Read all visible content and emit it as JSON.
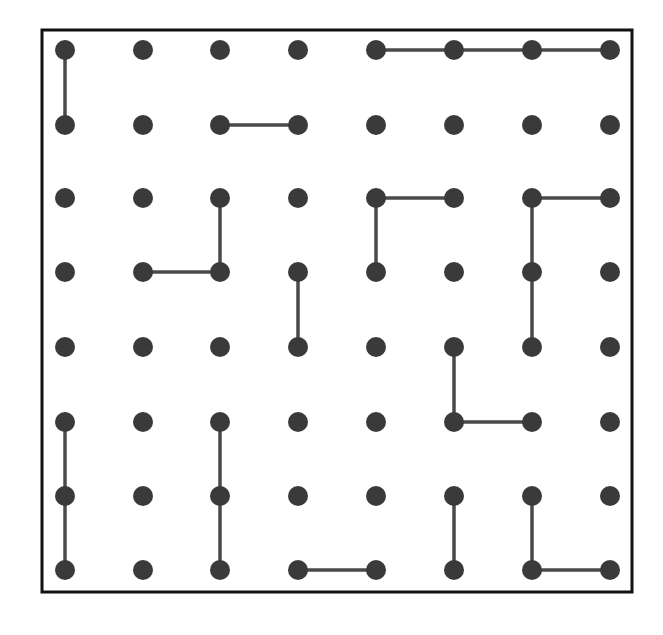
{
  "puzzle": {
    "type": "dot-grid",
    "columns": 8,
    "rows": 8,
    "colors": {
      "dot": "#3a3a3a",
      "line": "#4a4a4a",
      "border": "#111111",
      "background": "#ffffff"
    },
    "x_positions": [
      65,
      143,
      220,
      298,
      376,
      454,
      532,
      610
    ],
    "y_positions": [
      50,
      125,
      198,
      272,
      347,
      422,
      496,
      570
    ],
    "segments": [
      [
        [
          0,
          0
        ],
        [
          0,
          1
        ]
      ],
      [
        [
          4,
          0
        ],
        [
          5,
          0
        ]
      ],
      [
        [
          5,
          0
        ],
        [
          6,
          0
        ]
      ],
      [
        [
          6,
          0
        ],
        [
          7,
          0
        ]
      ],
      [
        [
          2,
          1
        ],
        [
          3,
          1
        ]
      ],
      [
        [
          4,
          2
        ],
        [
          5,
          2
        ]
      ],
      [
        [
          4,
          2
        ],
        [
          4,
          3
        ]
      ],
      [
        [
          6,
          2
        ],
        [
          7,
          2
        ]
      ],
      [
        [
          6,
          2
        ],
        [
          6,
          3
        ]
      ],
      [
        [
          6,
          3
        ],
        [
          6,
          4
        ]
      ],
      [
        [
          2,
          2
        ],
        [
          2,
          3
        ]
      ],
      [
        [
          1,
          3
        ],
        [
          2,
          3
        ]
      ],
      [
        [
          3,
          3
        ],
        [
          3,
          4
        ]
      ],
      [
        [
          5,
          4
        ],
        [
          5,
          5
        ]
      ],
      [
        [
          5,
          5
        ],
        [
          6,
          5
        ]
      ],
      [
        [
          0,
          5
        ],
        [
          0,
          6
        ]
      ],
      [
        [
          0,
          6
        ],
        [
          0,
          7
        ]
      ],
      [
        [
          2,
          5
        ],
        [
          2,
          6
        ]
      ],
      [
        [
          2,
          6
        ],
        [
          2,
          7
        ]
      ],
      [
        [
          3,
          7
        ],
        [
          4,
          7
        ]
      ],
      [
        [
          5,
          6
        ],
        [
          5,
          7
        ]
      ],
      [
        [
          6,
          6
        ],
        [
          6,
          7
        ]
      ],
      [
        [
          6,
          7
        ],
        [
          7,
          7
        ]
      ]
    ]
  }
}
